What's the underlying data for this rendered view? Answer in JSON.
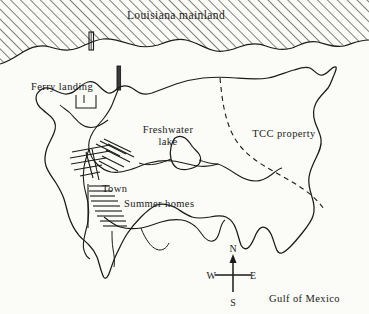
{
  "figure": {
    "kind": "hand-drawn-locator-map",
    "background_color": "#fbfbf7",
    "ink_color": "#1a1a1a"
  },
  "labels": {
    "mainland": "Louisiana mainland",
    "ferry_landing": "Ferry landing",
    "freshwater_lake_line1": "Freshwater",
    "freshwater_lake_line2": "lake",
    "tcc_property": "TCC property",
    "town": "Town",
    "summer_homes": "Summer homes",
    "gulf_of_mexico": "Gulf of Mexico"
  },
  "compass": {
    "north": "N",
    "south": "S",
    "east": "E",
    "west": "W"
  },
  "features": {
    "mainland_fill": "diagonal-hatch",
    "island_outline": "irregular-coastline",
    "lake_outline": "small-closed-polygon",
    "property_boundary": "dashed-line",
    "town_streets": "hatch-marks",
    "piers": 2
  }
}
